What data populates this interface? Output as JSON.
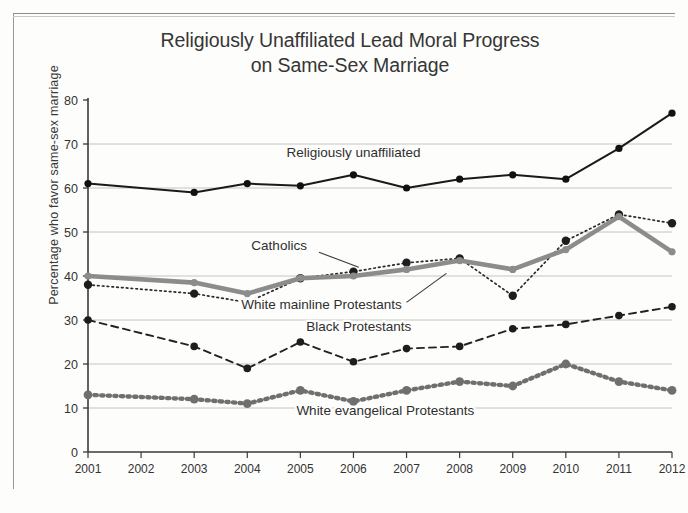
{
  "figure": {
    "title_line1": "Religiously Unaffiliated Lead Moral Progress",
    "title_line2": "on Same-Sex Marriage",
    "ylabel": "Percentage who favor same-sex marriage"
  },
  "chart_data": {
    "type": "line",
    "title": "Religiously Unaffiliated Lead Moral Progress on Same-Sex Marriage",
    "xlabel": "",
    "ylabel": "Percentage who favor same-sex marriage",
    "ylim": [
      0,
      80
    ],
    "yticks": [
      0,
      10,
      20,
      30,
      40,
      50,
      60,
      70,
      80
    ],
    "grid": "horizontal",
    "legend_position": "inline-annotations",
    "xtick_labels": [
      "2001",
      "2002",
      "2003",
      "2004",
      "2005",
      "2006",
      "2007",
      "2008",
      "2009",
      "2010",
      "2011",
      "2012"
    ],
    "x": [
      2001,
      2003,
      2004,
      2005,
      2006,
      2007,
      2008,
      2009,
      2010,
      2011,
      2012
    ],
    "series": [
      {
        "name": "Religiously unaffiliated",
        "style": "solid-thin-black",
        "color": "#1a1a1a",
        "values": [
          61,
          59,
          61,
          60.5,
          63,
          60,
          62,
          63,
          62,
          69,
          77
        ]
      },
      {
        "name": "Catholics",
        "style": "dotted-black",
        "color": "#2a2a2a",
        "values": [
          38,
          36,
          34,
          39.5,
          41,
          43,
          44,
          35.5,
          48,
          54,
          52
        ]
      },
      {
        "name": "White mainline Protestants",
        "style": "solid-thick-gray",
        "color": "#8c8c8c",
        "values": [
          40,
          38.5,
          36,
          39.5,
          40,
          41.5,
          43.5,
          41.5,
          46,
          53.5,
          45.5
        ]
      },
      {
        "name": "Black Protestants",
        "style": "dashed-black",
        "color": "#222222",
        "values": [
          30,
          24,
          19,
          25,
          20.5,
          23.5,
          24,
          28,
          29,
          31,
          33
        ]
      },
      {
        "name": "White evangelical Protestants",
        "style": "dotted-thick-gray",
        "color": "#6f6f6f",
        "values": [
          13,
          12,
          11,
          14,
          11.5,
          14,
          16,
          15,
          20,
          16,
          14
        ]
      }
    ],
    "annotations": [
      {
        "text": "Religiously unaffiliated",
        "x": 2006,
        "y": 67,
        "leader": false
      },
      {
        "text": "Catholics",
        "x": 2004.6,
        "y": 46,
        "leader": true
      },
      {
        "text": "White mainline Protestants",
        "x": 2005.4,
        "y": 32.5,
        "leader": true
      },
      {
        "text": "Black Protestants",
        "x": 2006.1,
        "y": 27.5,
        "leader": false
      },
      {
        "text": "White evangelical Protestants",
        "x": 2006.6,
        "y": 8.5,
        "leader": false
      }
    ]
  }
}
